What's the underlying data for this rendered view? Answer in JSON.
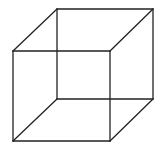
{
  "figure": {
    "type": "necker-cube",
    "width": 163,
    "height": 148,
    "background": "#ffffff",
    "stroke_color": "#222222",
    "vertices": {
      "front_top_left": [
        13,
        51
      ],
      "front_top_right": [
        110,
        51
      ],
      "front_bottom_left": [
        13,
        141
      ],
      "front_bottom_right": [
        110,
        141
      ],
      "back_top_left": [
        57,
        9
      ],
      "back_top_right": [
        153,
        9
      ],
      "back_bottom_left": [
        57,
        99
      ],
      "back_bottom_right": [
        153,
        99
      ]
    },
    "edges": [
      [
        "front_top_left",
        "front_top_right"
      ],
      [
        "front_top_right",
        "front_bottom_right"
      ],
      [
        "front_bottom_right",
        "front_bottom_left"
      ],
      [
        "front_bottom_left",
        "front_top_left"
      ],
      [
        "back_top_left",
        "back_top_right"
      ],
      [
        "back_top_right",
        "back_bottom_right"
      ],
      [
        "back_bottom_right",
        "back_bottom_left"
      ],
      [
        "back_bottom_left",
        "back_top_left"
      ],
      [
        "front_top_left",
        "back_top_left"
      ],
      [
        "front_top_right",
        "back_top_right"
      ],
      [
        "front_bottom_left",
        "back_bottom_left"
      ],
      [
        "front_bottom_right",
        "back_bottom_right"
      ]
    ]
  }
}
